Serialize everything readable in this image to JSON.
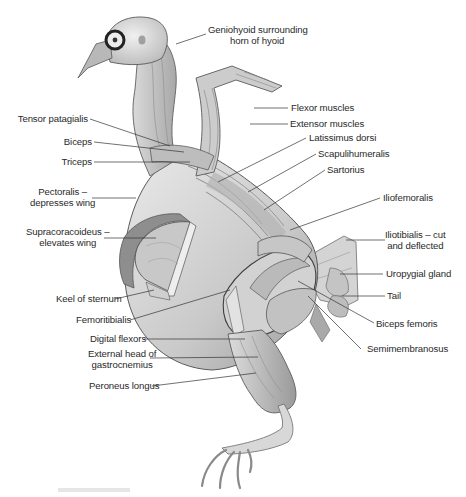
{
  "figure": {
    "ink_color": "#3a3a3a",
    "text_color": "#2a2a2a",
    "labels_left": [
      {
        "id": "tensor-patagialis",
        "text": "Tensor patagialis"
      },
      {
        "id": "biceps",
        "text": "Biceps"
      },
      {
        "id": "triceps",
        "text": "Triceps"
      },
      {
        "id": "pectoralis",
        "line1": "Pectoralis –",
        "line2": "depresses wing"
      },
      {
        "id": "supracoracoideus",
        "line1": "Supracoracoideus –",
        "line2": "elevates wing"
      },
      {
        "id": "keel-of-sternum",
        "text": "Keel of sternum"
      },
      {
        "id": "femoritibialis",
        "text": "Femoritibialis"
      },
      {
        "id": "digital-flexors",
        "text": "Digital flexors"
      },
      {
        "id": "external-head-gastrocnemius",
        "line1": "External head of",
        "line2": "gastrocnemius"
      },
      {
        "id": "peroneus-longus",
        "text": "Peroneus longus"
      }
    ],
    "labels_right": [
      {
        "id": "geniohyoid",
        "line1": "Geniohyoid surrounding",
        "line2": "horn of hyoid"
      },
      {
        "id": "flexor-muscles",
        "text": "Flexor muscles"
      },
      {
        "id": "extensor-muscles",
        "text": "Extensor muscles"
      },
      {
        "id": "latissimus-dorsi",
        "text": "Latissimus dorsi"
      },
      {
        "id": "scapulihumeralis",
        "text": "Scapulihumeralis"
      },
      {
        "id": "sartorius",
        "text": "Sartorius"
      },
      {
        "id": "iliofemoralis",
        "text": "Iliofemoralis"
      },
      {
        "id": "iliotibialis",
        "line1": "Iliotibialis – cut",
        "line2": "and deflected"
      },
      {
        "id": "uropygial-gland",
        "text": "Uropygial gland"
      },
      {
        "id": "tail",
        "text": "Tail"
      },
      {
        "id": "biceps-femoris",
        "text": "Biceps femoris"
      },
      {
        "id": "semimembranosus",
        "text": "Semimembranosus"
      }
    ]
  }
}
